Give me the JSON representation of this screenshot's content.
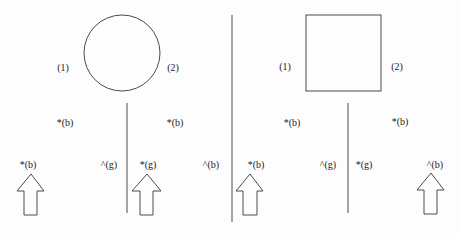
{
  "colors": {
    "stroke": "#4a4a4a",
    "text": "#222222",
    "background": "#fdfdfd"
  },
  "panels": [
    {
      "shape": "circle",
      "labels": {
        "left": "(1)",
        "right": "(2)"
      },
      "upper": {
        "left": "*(b)",
        "right": "*(b)"
      },
      "lower": {
        "a": "*(b)",
        "b": "^(g)",
        "c": "*(g)",
        "d": "^(b)"
      }
    },
    {
      "shape": "square",
      "labels": {
        "left": "(1)",
        "right": "(2)"
      },
      "upper": {
        "left": "*(b)",
        "right": "*(b)"
      },
      "lower": {
        "a": "*(b)",
        "b": "^(g)",
        "c": "*(g)",
        "d": "^(b)"
      }
    }
  ]
}
